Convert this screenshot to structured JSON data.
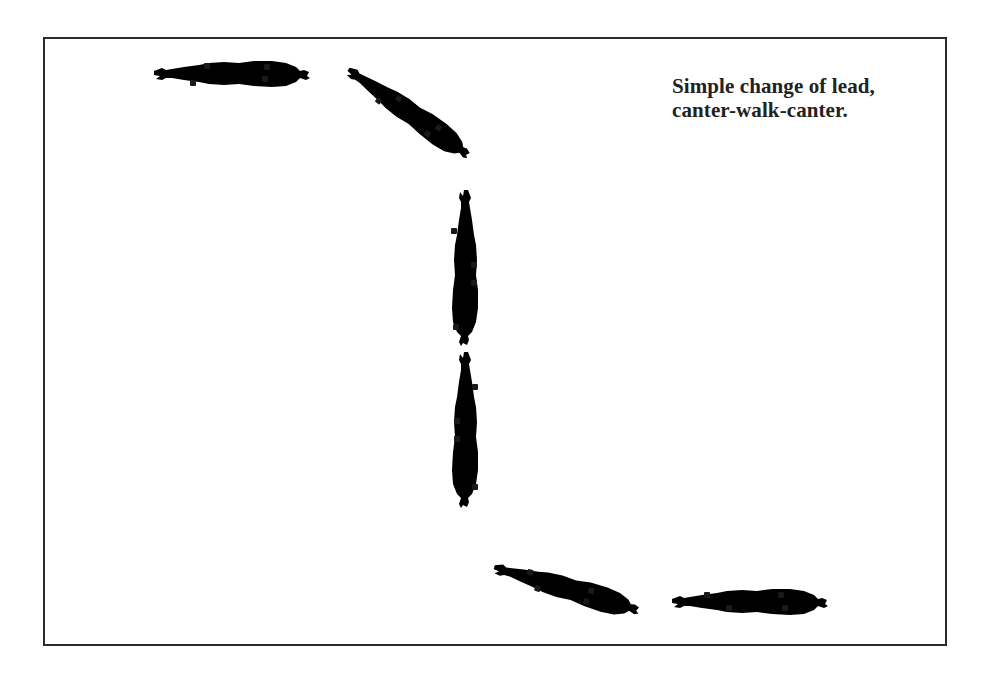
{
  "caption": {
    "line1": "Simple change of lead,",
    "line2": "canter-walk-canter."
  },
  "figure": {
    "horses": [
      {
        "id": 1,
        "position": "top-left",
        "heading": "left",
        "gait": "canter"
      },
      {
        "id": 2,
        "position": "top-center",
        "heading": "up-left diagonal",
        "gait": "canter"
      },
      {
        "id": 3,
        "position": "center-upper",
        "heading": "up",
        "gait": "walk"
      },
      {
        "id": 4,
        "position": "center-lower",
        "heading": "up",
        "gait": "walk"
      },
      {
        "id": 5,
        "position": "bottom-center",
        "heading": "up-left diagonal",
        "gait": "canter"
      },
      {
        "id": 6,
        "position": "bottom-right",
        "heading": "left",
        "gait": "canter"
      }
    ],
    "colors": {
      "border": "#2b2b2b",
      "outline": "#333333",
      "hoof": "#1a1a1a",
      "background": "#ffffff"
    }
  }
}
